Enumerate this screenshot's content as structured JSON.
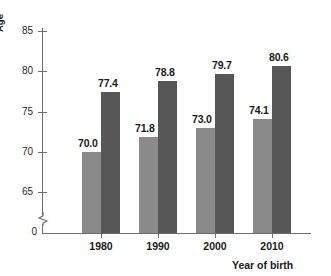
{
  "chart_data": {
    "type": "bar",
    "title": "",
    "xlabel": "Year of birth",
    "ylabel": "Age",
    "categories": [
      "1980",
      "1990",
      "2000",
      "2010"
    ],
    "series": [
      {
        "name": "series-light",
        "color": "#8a8a8a",
        "values": [
          70.0,
          71.8,
          73.0,
          74.1
        ]
      },
      {
        "name": "series-dark",
        "color": "#575757",
        "values": [
          77.4,
          78.8,
          79.7,
          80.6
        ]
      }
    ],
    "value_labels": {
      "series-light": [
        "70.0",
        "71.8",
        "73.0",
        "74.1"
      ],
      "series-dark": [
        "77.4",
        "78.8",
        "79.7",
        "80.6"
      ]
    },
    "yticks": [
      65,
      70,
      75,
      80,
      85
    ],
    "ytick_labels": [
      "65",
      "70",
      "75",
      "80",
      "85"
    ],
    "y_origin_label": "0",
    "ylim": [
      63.5,
      86.5
    ],
    "y_axis_break": true,
    "grid": false,
    "legend": "none",
    "axis_color": "#6e6e6e",
    "text_color": "#1a1a1a"
  }
}
